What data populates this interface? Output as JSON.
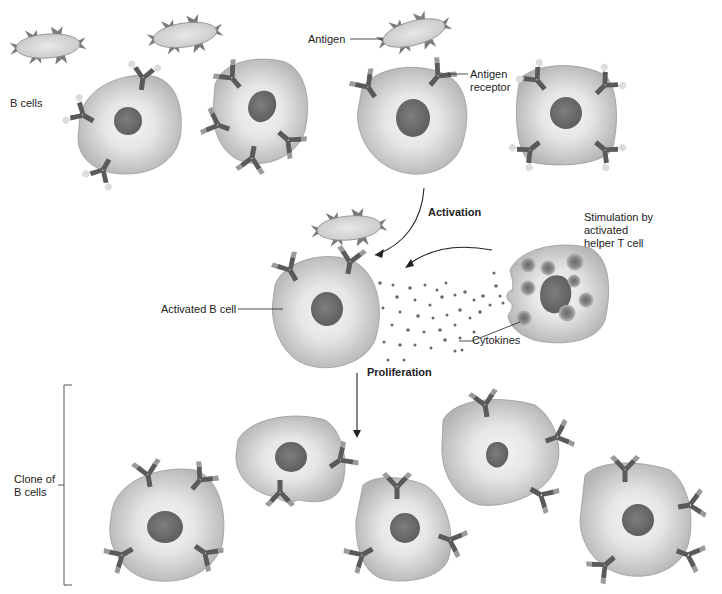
{
  "diagram": {
    "colors": {
      "cell_fill_outer": "#bdbdbd",
      "cell_fill_inner": "#ececec",
      "cell_stroke": "#8a8a8a",
      "nucleus": "#6e6e6e",
      "receptor": "#5a5a5a",
      "receptor_tip": "#9a9a9a",
      "antigen_fill": "#d8d8d8",
      "antigen_spike": "#7a7a7a",
      "cytokine": "#6a6a6a",
      "line": "#222222"
    },
    "labels": {
      "b_cells": "B cells",
      "antigen": "Antigen",
      "antigen_receptor": "Antigen\nreceptor",
      "activation": "Activation",
      "stimulation": "Stimulation by\nactivated\nhelper T cell",
      "activated_b_cell": "Activated B cell",
      "cytokines": "Cytokines",
      "proliferation": "Proliferation",
      "clone_of_b_cells": "Clone of\nB cells"
    },
    "stages": [
      {
        "name": "Resting B cells",
        "cell_count": 4,
        "free_antigens": 3
      },
      {
        "name": "Activation",
        "cell_count": 1,
        "helper_t_cell": 1
      },
      {
        "name": "Proliferation",
        "cell_count": 5
      }
    ]
  }
}
